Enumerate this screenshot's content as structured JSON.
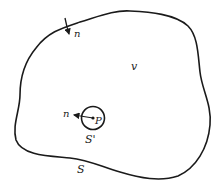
{
  "diagram": {
    "outer_surface_label": "S",
    "inner_surface_label": "S'",
    "volume_label": "v",
    "point_label": "P",
    "outer_normal_label": "n",
    "inner_normal_label": "n",
    "stroke_color": "#1a1a1a"
  }
}
